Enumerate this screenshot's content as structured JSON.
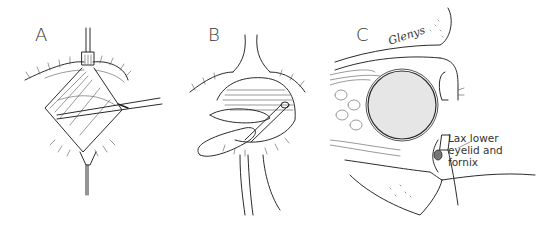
{
  "figure": {
    "panels": [
      {
        "id": "A",
        "label": "A",
        "description": "Eyelid retracted with hook superiorly and inferiorly; forceps inserted laterally"
      },
      {
        "id": "B",
        "label": "B",
        "description": "Sutures passed through lower eyelid with needle holder; suture ends trailing downward"
      },
      {
        "id": "C",
        "label": "C",
        "description": "Sagittal cross-section of orbit showing globe and lax lower eyelid"
      }
    ],
    "annotations": {
      "panel_c_callout_line1": "Lax lower",
      "panel_c_callout_line2": "eyelid and",
      "panel_c_callout_line3": "fornix",
      "signature": "Glenys"
    },
    "colors": {
      "ink": "#2b2b2b",
      "background": "#ffffff",
      "globe_fill": "#e6e6e6"
    }
  }
}
